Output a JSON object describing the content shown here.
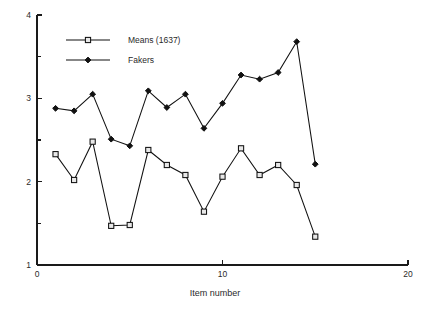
{
  "chart_data": {
    "type": "line",
    "title": "",
    "xlabel": "Item number",
    "ylabel": "",
    "xlim": [
      0,
      20
    ],
    "ylim": [
      1,
      4
    ],
    "x": [
      1,
      2,
      3,
      4,
      5,
      6,
      7,
      8,
      9,
      10,
      11,
      12,
      13,
      14,
      15
    ],
    "xticks": [
      0,
      10,
      20
    ],
    "xtick_labels": [
      "0",
      "10",
      "20"
    ],
    "yticks": [
      1,
      1.5,
      2,
      2.5,
      3,
      3.5,
      4
    ],
    "ytick_labels": [
      "1",
      "",
      "2",
      "",
      "3",
      "",
      "4"
    ],
    "ytick_labels_shown": [
      "4",
      "3",
      "2",
      "1"
    ],
    "grid": false,
    "legend_position": "upper left",
    "series": [
      {
        "name": "Means (1637)",
        "marker": "open-square",
        "values": [
          2.33,
          2.02,
          2.48,
          1.47,
          1.48,
          2.38,
          2.2,
          2.08,
          1.64,
          2.06,
          2.4,
          2.08,
          2.2,
          1.96,
          1.34
        ]
      },
      {
        "name": "Fakers",
        "marker": "filled-diamond",
        "values": [
          2.88,
          2.85,
          3.05,
          2.51,
          2.43,
          3.09,
          2.89,
          3.05,
          2.64,
          2.94,
          3.28,
          3.23,
          3.31,
          3.68,
          2.21
        ]
      }
    ]
  },
  "legend": {
    "entries": [
      {
        "label": "Means (1637)"
      },
      {
        "label": "Fakers"
      }
    ]
  },
  "axes": {
    "x_title": "Item number",
    "x_tick_labels": [
      "0",
      "10",
      "20"
    ],
    "y_tick_labels": [
      "4",
      "3",
      "2",
      "1"
    ]
  }
}
